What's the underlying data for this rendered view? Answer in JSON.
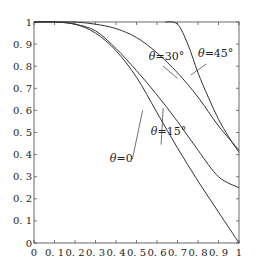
{
  "chart_data": {
    "type": "line",
    "title": "",
    "xlabel": "",
    "ylabel": "",
    "xlim": [
      0,
      1
    ],
    "ylim": [
      0,
      1
    ],
    "grid": false,
    "legend_position": "inline annotations",
    "x_ticks": [
      "0",
      "0.1",
      "0.2",
      "0.3",
      "0.4",
      "0.5",
      "0.6",
      "0.7",
      "0.8",
      "0.9",
      "1"
    ],
    "y_ticks": [
      "0",
      "0.1",
      "0.2",
      "0.3",
      "0.4",
      "0.5",
      "0.6",
      "0.7",
      "0.8",
      "0.9",
      "1"
    ],
    "series": [
      {
        "name": "θ=0",
        "label": "θ=0",
        "x": [
          0,
          0.1,
          0.2,
          0.3,
          0.4,
          0.5,
          0.6,
          0.7,
          0.8,
          0.9,
          1.0
        ],
        "y": [
          1,
          1,
          0.99,
          0.95,
          0.87,
          0.75,
          0.59,
          0.43,
          0.28,
          0.14,
          0.0
        ],
        "label_pos": [
          0.37,
          0.365
        ],
        "leader": [
          [
            0.48,
            0.38
          ],
          [
            0.53,
            0.6
          ]
        ]
      },
      {
        "name": "θ=15°",
        "label": "θ=15°",
        "x": [
          0,
          0.1,
          0.2,
          0.3,
          0.4,
          0.5,
          0.6,
          0.7,
          0.8,
          0.9,
          1.0
        ],
        "y": [
          1,
          1,
          0.99,
          0.96,
          0.88,
          0.78,
          0.67,
          0.55,
          0.42,
          0.3,
          0.25
        ],
        "label_pos": [
          0.57,
          0.49
        ],
        "leader": [
          [
            0.62,
            0.445
          ],
          [
            0.63,
            0.61
          ]
        ]
      },
      {
        "name": "θ=30°",
        "label": "θ=30°",
        "x": [
          0,
          0.1,
          0.2,
          0.3,
          0.4,
          0.5,
          0.6,
          0.7,
          0.8,
          0.9,
          1.0
        ],
        "y": [
          1,
          1,
          1,
          0.99,
          0.97,
          0.93,
          0.86,
          0.77,
          0.66,
          0.53,
          0.42
        ],
        "label_pos": [
          0.56,
          0.83
        ],
        "leader": [
          [
            0.63,
            0.8
          ],
          [
            0.7,
            0.745
          ]
        ]
      },
      {
        "name": "θ=45°",
        "label": "θ=45°",
        "x": [
          0.64,
          0.7,
          0.75,
          0.8,
          0.85,
          0.9,
          0.95,
          1.0
        ],
        "y": [
          1,
          0.99,
          0.9,
          0.77,
          0.66,
          0.56,
          0.48,
          0.41
        ],
        "label_pos": [
          0.8,
          0.84
        ],
        "leader": [
          [
            0.84,
            0.81
          ],
          [
            0.765,
            0.76
          ]
        ]
      }
    ],
    "colors": {
      "curve": "#333333",
      "axis": "#444444",
      "background": "#ffffff"
    }
  }
}
